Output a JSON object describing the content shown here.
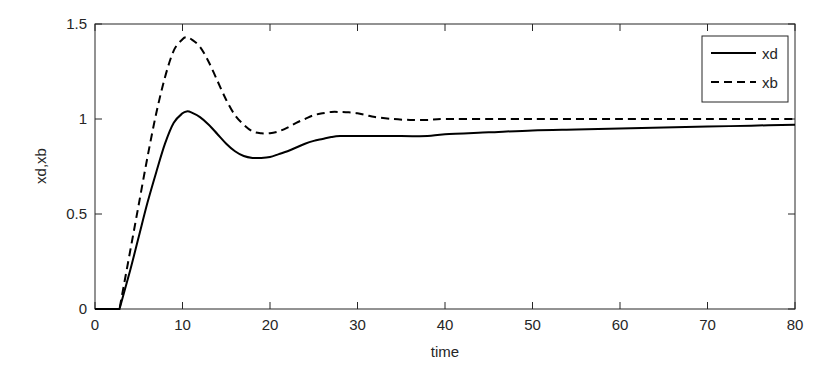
{
  "chart_data": {
    "type": "line",
    "title": "",
    "xlabel": "time",
    "ylabel": "xd,xb",
    "xlim": [
      0,
      80
    ],
    "ylim": [
      0,
      1.5
    ],
    "xticks": [
      0,
      10,
      20,
      30,
      40,
      50,
      60,
      70,
      80
    ],
    "yticks": [
      0,
      0.5,
      1,
      1.5
    ],
    "xtick_labels": [
      "0",
      "10",
      "20",
      "30",
      "40",
      "50",
      "60",
      "70",
      "80"
    ],
    "ytick_labels": [
      "0",
      "0.5",
      "1",
      "1.5"
    ],
    "grid": false,
    "legend_position": "upper right",
    "series": [
      {
        "name": "xd",
        "style": "solid",
        "color": "#000000",
        "x": [
          0,
          2.8,
          4,
          5,
          6,
          7,
          8,
          9,
          10,
          10.5,
          11,
          12,
          13,
          14,
          15,
          16,
          17,
          18,
          19,
          20,
          21,
          22,
          23,
          24,
          25,
          26,
          27,
          28,
          30,
          35,
          38,
          40,
          45,
          50,
          55,
          60,
          65,
          70,
          75,
          80
        ],
        "y": [
          0,
          0,
          0.2,
          0.38,
          0.56,
          0.72,
          0.87,
          0.98,
          1.03,
          1.04,
          1.035,
          1.01,
          0.97,
          0.92,
          0.87,
          0.83,
          0.805,
          0.795,
          0.795,
          0.8,
          0.815,
          0.83,
          0.85,
          0.87,
          0.885,
          0.895,
          0.905,
          0.91,
          0.91,
          0.91,
          0.91,
          0.92,
          0.93,
          0.94,
          0.945,
          0.95,
          0.955,
          0.96,
          0.965,
          0.97
        ]
      },
      {
        "name": "xb",
        "style": "dashed",
        "color": "#000000",
        "x": [
          0,
          2.8,
          4,
          5,
          6,
          7,
          8,
          9,
          10,
          10.5,
          11,
          12,
          13,
          14,
          15,
          16,
          17,
          18,
          19,
          20,
          21,
          22,
          23,
          24,
          25,
          26,
          27,
          28,
          29,
          30,
          31,
          32,
          34,
          36,
          38,
          40,
          45,
          50,
          60,
          70,
          80
        ],
        "y": [
          0,
          0,
          0.3,
          0.55,
          0.8,
          1.03,
          1.22,
          1.36,
          1.42,
          1.43,
          1.42,
          1.38,
          1.3,
          1.2,
          1.1,
          1.02,
          0.97,
          0.935,
          0.925,
          0.925,
          0.935,
          0.955,
          0.98,
          1.0,
          1.02,
          1.03,
          1.037,
          1.037,
          1.035,
          1.03,
          1.02,
          1.01,
          1.0,
          0.995,
          0.995,
          1.0,
          1.0,
          1.0,
          1.0,
          1.0,
          1.0
        ]
      }
    ]
  }
}
